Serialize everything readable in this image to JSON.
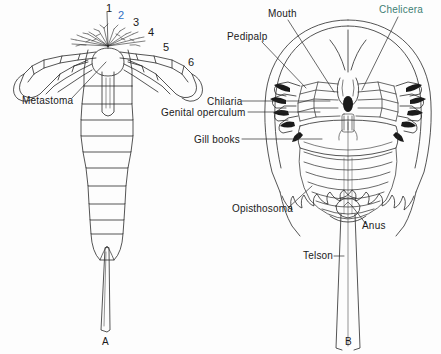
{
  "figure": {
    "background_color": "#fdfdfd",
    "ink_color": "#2a2a2a",
    "accent_blue": "#2f6fc4",
    "accent_teal": "#3d7f74"
  },
  "panel_a": {
    "caption": "A",
    "subject": "eurypterid-ventral-view",
    "labels": [
      {
        "name": "metastoma",
        "text": "Metastoma",
        "x": 22,
        "y": 96
      }
    ],
    "numbers": [
      {
        "name": "appendage-1",
        "text": "1",
        "x": 106,
        "y": 3,
        "color": "black"
      },
      {
        "name": "appendage-2",
        "text": "2",
        "x": 118,
        "y": 10,
        "color": "blue"
      },
      {
        "name": "appendage-3",
        "text": "3",
        "x": 133,
        "y": 17,
        "color": "black"
      },
      {
        "name": "appendage-4",
        "text": "4",
        "x": 148,
        "y": 27,
        "color": "black"
      },
      {
        "name": "appendage-5",
        "text": "5",
        "x": 163,
        "y": 42,
        "color": "black"
      },
      {
        "name": "appendage-6",
        "text": "6",
        "x": 188,
        "y": 57,
        "color": "black"
      }
    ]
  },
  "panel_b": {
    "caption": "B",
    "subject": "horseshoe-crab-ventral-view",
    "labels": [
      {
        "name": "mouth",
        "text": "Mouth",
        "x": 268,
        "y": 9
      },
      {
        "name": "chelicera",
        "text": "Chelicera",
        "x": 379,
        "y": 5,
        "color": "teal"
      },
      {
        "name": "pedipalp",
        "text": "Pedipalp",
        "x": 227,
        "y": 32
      },
      {
        "name": "chilaria",
        "text": "Chilaria",
        "x": 207,
        "y": 97
      },
      {
        "name": "genital-operculum",
        "text": "Genital operculum",
        "x": 161,
        "y": 108
      },
      {
        "name": "gill-books",
        "text": "Gill books",
        "x": 194,
        "y": 135
      },
      {
        "name": "opisthosoma",
        "text": "Opisthosoma",
        "x": 232,
        "y": 209
      },
      {
        "name": "anus",
        "text": "Anus",
        "x": 362,
        "y": 228
      },
      {
        "name": "telson",
        "text": "Telson",
        "x": 303,
        "y": 252
      }
    ]
  },
  "captions": [
    {
      "name": "caption-a",
      "text": "A",
      "x": 102,
      "y": 337
    },
    {
      "name": "caption-b",
      "text": "B",
      "x": 345,
      "y": 337
    }
  ]
}
